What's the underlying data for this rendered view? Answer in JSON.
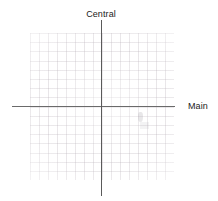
{
  "diagram": {
    "type": "cartesian-axes",
    "background_color": "#ffffff",
    "axes": {
      "horizontal": {
        "label": "Main",
        "color": "#6a6a6a",
        "orientation": "horizontal"
      },
      "vertical": {
        "label": "Central",
        "color": "#5a5a5a",
        "orientation": "vertical"
      }
    },
    "grid": {
      "visible": true,
      "color": "#aaa0aa",
      "style": "graph-paper",
      "columns": 16,
      "rows": 16
    },
    "origin": {
      "x": 101,
      "y": 107
    },
    "data_points": []
  }
}
